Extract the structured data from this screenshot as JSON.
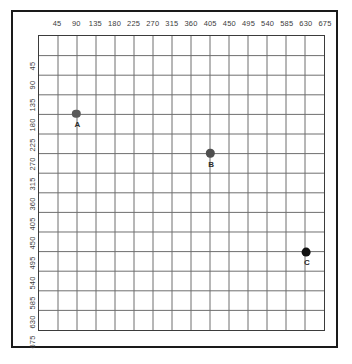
{
  "chart_data": {
    "type": "scatter",
    "title": "",
    "xlabel": "",
    "ylabel": "",
    "xlim": [
      0,
      720
    ],
    "ylim": [
      0,
      720
    ],
    "y_axis_direction": "inverted-top-down",
    "grid": true,
    "legend": "none",
    "x_ticks": [
      45,
      90,
      135,
      180,
      225,
      270,
      315,
      360,
      405,
      450,
      495,
      540,
      585,
      630,
      675
    ],
    "y_ticks": [
      45,
      90,
      135,
      180,
      225,
      270,
      315,
      360,
      405,
      450,
      495,
      540,
      585,
      630,
      675
    ],
    "tick_step": 45,
    "x_tick_labels": [
      "45",
      "90",
      "135",
      "180",
      "225",
      "270",
      "315",
      "360",
      "405",
      "450",
      "495",
      "540",
      "585",
      "630",
      "675"
    ],
    "y_tick_labels": [
      "45",
      "90",
      "135",
      "180",
      "225",
      "270",
      "315",
      "360",
      "405",
      "450",
      "495",
      "540",
      "585",
      "630",
      "675"
    ],
    "points": [
      {
        "label": "A",
        "x": 90,
        "y": 180,
        "color": "#5a5a5a",
        "radius": 4.2
      },
      {
        "label": "B",
        "x": 405,
        "y": 270,
        "color": "#4f4f4f",
        "radius": 4.2
      },
      {
        "label": "C",
        "x": 630,
        "y": 495,
        "color": "#111111",
        "radius": 4.4
      }
    ],
    "point_labels": [
      "A",
      "B",
      "C"
    ],
    "series": [
      {
        "name": "points",
        "x": [
          90,
          405,
          630
        ],
        "y": [
          180,
          270,
          495
        ],
        "labels": [
          "A",
          "B",
          "C"
        ]
      }
    ]
  },
  "style": {
    "grid_color": "#6e6e6e",
    "grid_minor_color": "#8f8f8f",
    "frame_color": "#1a1a1a",
    "plot_border_color": "#3b3b3b",
    "tick_text_color": "#3d3d3d",
    "background": "#ffffff"
  }
}
